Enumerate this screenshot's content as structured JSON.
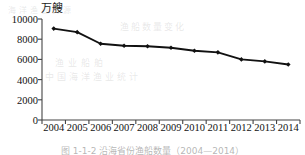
{
  "chart_data": {
    "type": "line",
    "title": "",
    "subtitle": "",
    "unit_label": "万艘",
    "xlabel": "",
    "ylabel": "",
    "ylim": [
      0,
      10000
    ],
    "yticks": [
      0,
      2000,
      4000,
      6000,
      8000,
      10000
    ],
    "ytick_labels": [
      "0",
      "2000",
      "4000",
      "6000",
      "8000",
      "10000"
    ],
    "grid": false,
    "legend": "none",
    "marker": "diamond",
    "line_color": "#111111",
    "categories": [
      "2004",
      "2005",
      "2006",
      "2007",
      "2008",
      "2009",
      "2010",
      "2011",
      "2012",
      "2013",
      "2014"
    ],
    "values": [
      9050,
      8700,
      7550,
      7350,
      7300,
      7150,
      6850,
      6700,
      6000,
      5800,
      5500
    ]
  },
  "figure": {
    "caption": "图 1-1-2  沿海省份渔船数量（2004—2014）"
  },
  "bleed_through": {
    "line1": "渔船数量变化",
    "line2": "渔业船舶",
    "line3": "中国海洋渔业统计",
    "line4": "海洋渔业资源"
  }
}
